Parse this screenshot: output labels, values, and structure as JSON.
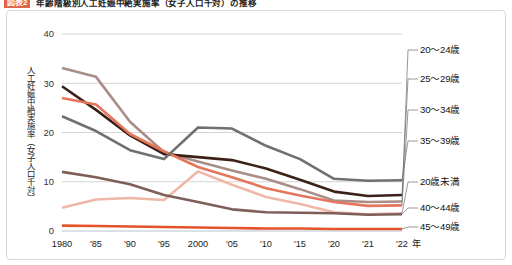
{
  "title": {
    "badge": "図表2",
    "text": "年齢階級別人工妊娠中絶実施率（女子人口千対）の推移"
  },
  "axis": {
    "y_label": "人工妊娠中絶実施率（女子人口千対）",
    "y_ticks": [
      "40",
      "30",
      "20",
      "10",
      "0"
    ],
    "x_ticks": [
      "1980",
      "'85",
      "'90",
      "'95",
      "2000",
      "'05",
      "'10",
      "'15",
      "'20",
      "'21",
      "'22"
    ],
    "x_unit": "年"
  },
  "colors": {
    "age_20_24": "#a98e88",
    "age_25_29": "#3b2018",
    "age_30_34": "#e4765c",
    "age_35_39": "#6e7072",
    "age_under20": "#eeb7a8",
    "age_40_44": "#7d5f58",
    "age_45_49": "#e4532a",
    "grid": "#c9c9c9",
    "badge": "#e06449"
  },
  "chart_data": {
    "type": "line",
    "title": "年齢階級別人工妊娠中絶実施率（女子人口千対）の推移",
    "xlabel": "年",
    "ylabel": "人工妊娠中絶実施率（女子人口千対）",
    "ylim": [
      0,
      40
    ],
    "grid": true,
    "legend_position": "right",
    "x": [
      "1980",
      "1985",
      "1990",
      "1995",
      "2000",
      "2005",
      "2010",
      "2015",
      "2020",
      "2021",
      "2022"
    ],
    "x_ticklabels": [
      "1980",
      "'85",
      "'90",
      "'95",
      "2000",
      "'05",
      "'10",
      "'15",
      "'20",
      "'21",
      "'22"
    ],
    "series": [
      {
        "name": "20〜24歳",
        "label": "20〜24歳",
        "color": "#a98e88",
        "values": [
          33.1,
          31.3,
          22.2,
          16.0,
          14.1,
          12.3,
          10.6,
          8.5,
          6.2,
          5.9,
          6.0
        ]
      },
      {
        "name": "25〜29歳",
        "label": "25〜29歳",
        "color": "#3b2018",
        "values": [
          29.4,
          24.6,
          19.4,
          15.6,
          15.0,
          14.4,
          12.7,
          10.4,
          8.0,
          7.1,
          7.3
        ]
      },
      {
        "name": "30〜34歳",
        "label": "30〜34歳",
        "color": "#e4765c",
        "values": [
          27.0,
          25.7,
          19.7,
          16.2,
          13.0,
          10.9,
          8.7,
          7.2,
          5.9,
          5.1,
          5.2
        ]
      },
      {
        "name": "35〜39歳",
        "label": "35〜39歳",
        "color": "#6e7072",
        "values": [
          23.3,
          20.3,
          16.4,
          14.6,
          21.0,
          20.8,
          17.3,
          14.6,
          10.6,
          10.2,
          10.3
        ]
      },
      {
        "name": "20歳未満",
        "label": "20歳未満",
        "color": "#eeb7a8",
        "values": [
          4.7,
          6.4,
          6.7,
          6.3,
          12.1,
          9.4,
          6.9,
          5.5,
          3.8,
          3.4,
          3.6
        ]
      },
      {
        "name": "40〜44歳",
        "label": "40〜44歳",
        "color": "#7d5f58",
        "values": [
          12.0,
          10.9,
          9.5,
          7.3,
          5.9,
          4.4,
          3.8,
          3.7,
          3.6,
          3.3,
          3.4
        ]
      },
      {
        "name": "45〜49歳",
        "label": "45〜49歳",
        "color": "#e4532a",
        "values": [
          1.1,
          1.0,
          0.9,
          0.8,
          0.7,
          0.6,
          0.5,
          0.5,
          0.4,
          0.4,
          0.4
        ]
      }
    ],
    "legend_entries": [
      "20〜24歳",
      "25〜29歳",
      "30〜34歳",
      "35〜39歳",
      "20歳未満",
      "40〜44歳",
      "45〜49歳"
    ]
  }
}
